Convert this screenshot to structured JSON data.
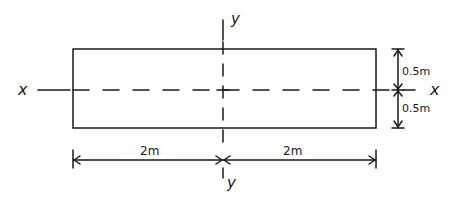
{
  "diagram": {
    "type": "rectangular cross-section",
    "axes": {
      "horizontal": {
        "label_left": "x",
        "label_right": "x"
      },
      "vertical": {
        "label_top": "y",
        "label_bottom": "y"
      }
    },
    "dimensions": {
      "left_width": "2m",
      "right_width": "2m",
      "top_half_height": "0.5m",
      "bottom_half_height": "0.5m"
    },
    "colors": {
      "ink": "#1a1a1a",
      "background": "#ffffff"
    }
  }
}
